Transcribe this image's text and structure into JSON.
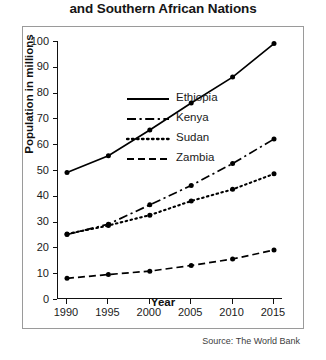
{
  "title": {
    "visible_line": "and Southern African Nations",
    "note_cropped": true
  },
  "source": "Source: The World Bank",
  "axes": {
    "y_title": "Population in millions",
    "x_title": "Year",
    "y_ticks": [
      "0",
      "10",
      "20",
      "30",
      "40",
      "50",
      "60",
      "70",
      "80",
      "90",
      "100"
    ],
    "x_ticks": [
      "1990",
      "1995",
      "2000",
      "2005",
      "2010",
      "2015"
    ]
  },
  "legend": {
    "items": [
      {
        "label": "Ethiopia",
        "dash": "none"
      },
      {
        "label": "Kenya",
        "dash": "dashdot"
      },
      {
        "label": "Sudan",
        "dash": "dotted"
      },
      {
        "label": "Zambia",
        "dash": "dashed"
      }
    ]
  },
  "chart_data": {
    "type": "line",
    "title": "and Southern African Nations",
    "xlabel": "Year",
    "ylabel": "Population in millions",
    "x": [
      1990,
      1995,
      2000,
      2005,
      2010,
      2015
    ],
    "xlim": [
      1990,
      2015
    ],
    "ylim": [
      0,
      100
    ],
    "ytick_step": 10,
    "grid": false,
    "legend_position": "upper-left inside plot",
    "markers": "filled circles",
    "color": "#000000",
    "source": "Source: The World Bank",
    "series": [
      {
        "name": "Ethiopia",
        "style": "solid",
        "values": [
          49,
          55.5,
          65.5,
          76,
          86,
          99
        ]
      },
      {
        "name": "Kenya",
        "style": "dashdot",
        "values": [
          25,
          29,
          36.5,
          44,
          52.5,
          62
        ]
      },
      {
        "name": "Sudan",
        "style": "dotted",
        "values": [
          25.2,
          28.5,
          32.5,
          38,
          42.5,
          48.5
        ]
      },
      {
        "name": "Zambia",
        "style": "dashed",
        "values": [
          8,
          9.5,
          10.8,
          13,
          15.5,
          19
        ]
      }
    ]
  }
}
